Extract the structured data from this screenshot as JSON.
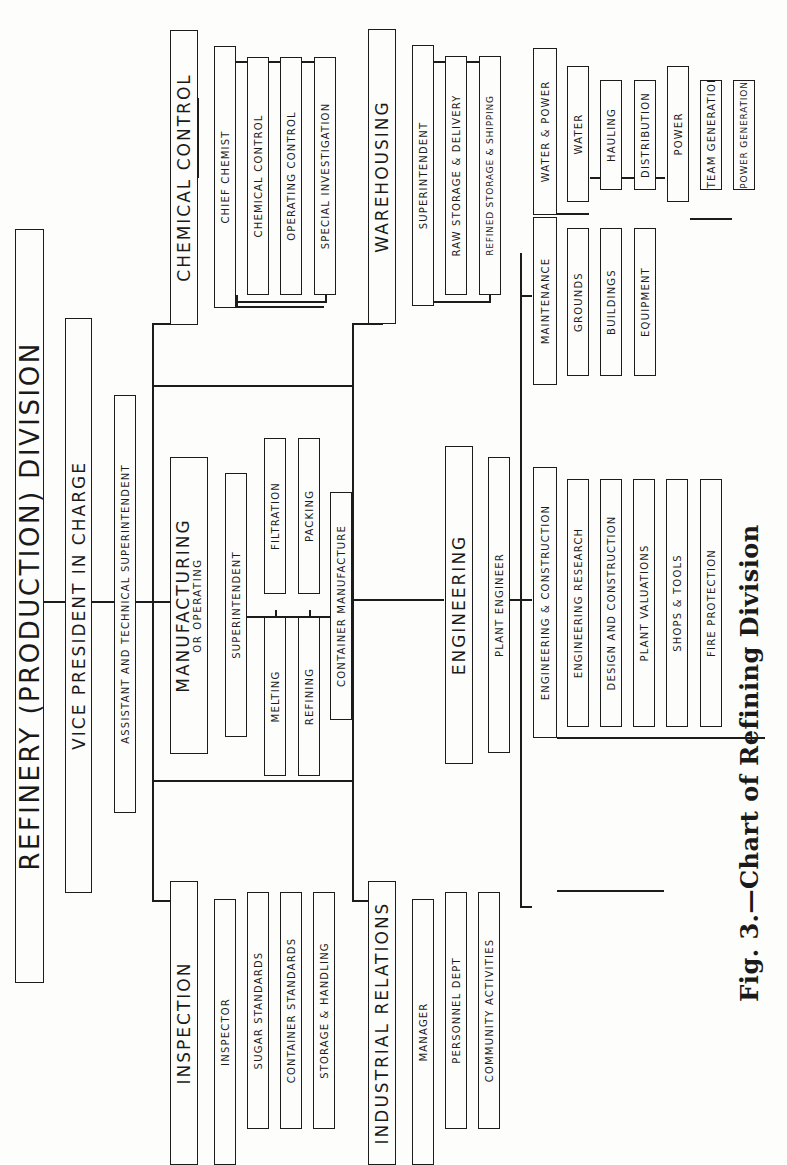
{
  "title": "REFINERY  (PRODUCTION)  DIVISION",
  "vp": "VICE PRESIDENT IN CHARGE",
  "assistant": "ASSISTANT AND TECHNICAL SUPERINTENDENT",
  "chemical_control": {
    "head": "CHEMICAL CONTROL",
    "manager": "CHIEF CHEMIST",
    "units": [
      "CHEMICAL CONTROL",
      "OPERATING CONTROL",
      "SPECIAL INVESTIGATION"
    ]
  },
  "warehousing": {
    "head": "WAREHOUSING",
    "manager": "SUPERINTENDENT",
    "units": [
      "RAW STORAGE & DELIVERY",
      "REFINED STORAGE & SHIPPING"
    ]
  },
  "manufacturing": {
    "head": "MANUFACTURING",
    "head_sub": "OR OPERATING",
    "manager": "SUPERINTENDENT",
    "units": [
      "FILTRATION",
      "PACKING",
      "MELTING",
      "REFINING",
      "CONTAINER MANUFACTURE"
    ]
  },
  "inspection": {
    "head": "INSPECTION",
    "manager": "INSPECTOR",
    "units": [
      "SUGAR STANDARDS",
      "CONTAINER STANDARDS",
      "STORAGE & HANDLING"
    ]
  },
  "industrial_relations": {
    "head": "INDUSTRIAL RELATIONS",
    "manager": "MANAGER",
    "units": [
      "PERSONNEL DEPT",
      "COMMUNITY ACTIVITIES"
    ]
  },
  "engineering": {
    "head": "ENGINEERING",
    "manager": "PLANT ENGINEER",
    "maintenance": {
      "head": "MAINTENANCE",
      "units": [
        "GROUNDS",
        "BUILDINGS",
        "EQUIPMENT"
      ]
    },
    "construction": {
      "head": "ENGINEERING & CONSTRUCTION",
      "units": [
        "ENGINEERING RESEARCH",
        "DESIGN AND CONSTRUCTION",
        "PLANT VALUATIONS",
        "SHOPS & TOOLS",
        "FIRE PROTECTION"
      ]
    },
    "water_power": {
      "head": "WATER & POWER",
      "water": {
        "head": "WATER",
        "units": [
          "HAULING",
          "DISTRIBUTION"
        ]
      },
      "power": {
        "head": "POWER",
        "units": [
          "STEAM GENERATION",
          "POWER GENERATION"
        ]
      }
    }
  },
  "caption": "Fig. 3.—Chart of Refining Division"
}
